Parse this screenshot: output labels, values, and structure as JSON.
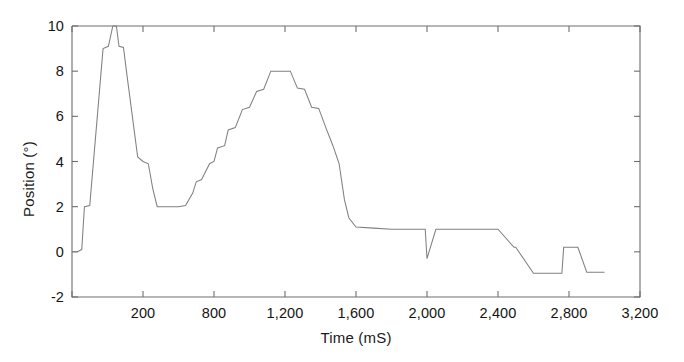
{
  "chart_data": {
    "type": "line",
    "title": "",
    "xlabel": "Time (mS)",
    "ylabel": "Position (°)",
    "xtick_labels": [
      "0",
      "200",
      "800",
      "1,200",
      "1,600",
      "2,000",
      "2,400",
      "2,800",
      "3,200"
    ],
    "ytick_labels": [
      "-2",
      "0",
      "2",
      "4",
      "6",
      "8",
      "10"
    ],
    "ytick_values": [
      -2,
      0,
      2,
      4,
      6,
      8,
      10
    ],
    "xlim": [
      0,
      3200
    ],
    "ylim": [
      -2,
      10
    ],
    "grid": false,
    "legend": false,
    "line_color": "#808080",
    "series": [
      {
        "name": "Position",
        "x": [
          0,
          30,
          55,
          70,
          100,
          175,
          205,
          230,
          250,
          265,
          290,
          310,
          350,
          370,
          400,
          430,
          455,
          480,
          520,
          560,
          600,
          640,
          680,
          700,
          730,
          775,
          800,
          820,
          860,
          880,
          920,
          960,
          1000,
          1040,
          1080,
          1120,
          1150,
          1190,
          1230,
          1270,
          1310,
          1350,
          1390,
          1430,
          1470,
          1505,
          1520,
          1535,
          1560,
          1600,
          1700,
          1800,
          1900,
          1990,
          2000,
          2050,
          2090,
          2100,
          2200,
          2300,
          2400,
          2490,
          2500,
          2600,
          2700,
          2760,
          2770,
          2850,
          2900,
          3000
        ],
        "y": [
          0,
          0,
          0.1,
          2,
          2.05,
          9,
          9.1,
          10,
          10,
          9.1,
          9.05,
          7.8,
          5.4,
          4.2,
          4.0,
          3.9,
          2.8,
          2.0,
          2.0,
          2.0,
          2.0,
          2.05,
          2.6,
          3.1,
          3.2,
          3.9,
          4.0,
          4.6,
          4.7,
          5.4,
          5.5,
          6.3,
          6.4,
          7.1,
          7.2,
          8.0,
          8.0,
          8.0,
          8.0,
          7.25,
          7.2,
          6.4,
          6.35,
          5.5,
          4.7,
          3.9,
          3.1,
          2.3,
          1.5,
          1.1,
          1.05,
          1.0,
          1.0,
          1.0,
          -0.3,
          1.0,
          1.0,
          1.0,
          1.0,
          1.0,
          1.0,
          0.2,
          0.2,
          -0.95,
          -0.95,
          -0.95,
          0.2,
          0.2,
          -0.9,
          -0.9
        ]
      }
    ],
    "annotations": [
      {
        "label": "first-peak-clipped-at-10",
        "x": 230,
        "y": 10
      },
      {
        "label": "valley-plateau-at-2",
        "x": 560,
        "y": 2
      },
      {
        "label": "second-peak-plateau-at-8",
        "x": 1190,
        "y": 8
      },
      {
        "label": "downward-spike",
        "x": 2050,
        "y": -0.3
      },
      {
        "label": "tail-plateau",
        "x": 2900,
        "y": -0.9
      }
    ]
  },
  "axis_style": {
    "axis_color": "#6e6e6e",
    "text_color": "#141414"
  }
}
